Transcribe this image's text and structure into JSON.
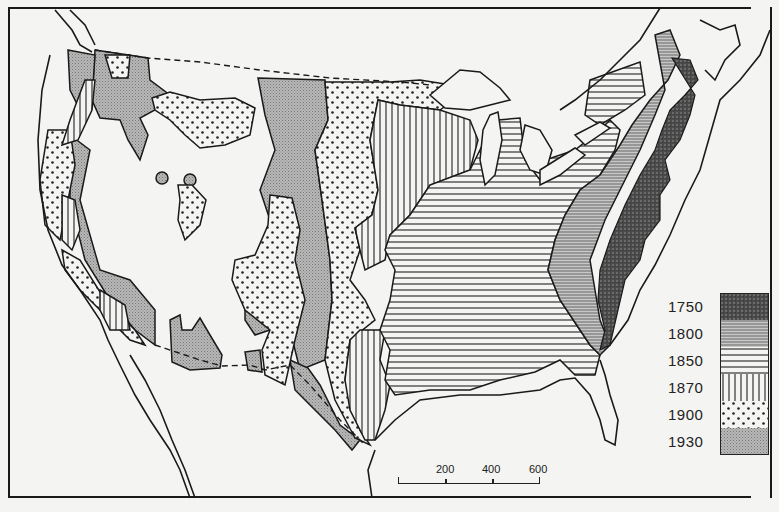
{
  "map": {
    "subject": "Settlement frontier of the United States by year",
    "background_color": "#f4f4f2",
    "line_color": "#1a1a1a"
  },
  "legend": {
    "items": [
      {
        "label": "1750",
        "pattern": "dark-stipple",
        "color": "#555555"
      },
      {
        "label": "1800",
        "pattern": "fine-horizontal-lines",
        "color": "#9a9a9a"
      },
      {
        "label": "1850",
        "pattern": "horizontal-lines",
        "color": "#ffffff"
      },
      {
        "label": "1870",
        "pattern": "vertical-lines",
        "color": "#ffffff"
      },
      {
        "label": "1900",
        "pattern": "dots",
        "color": "#ffffff"
      },
      {
        "label": "1930",
        "pattern": "fine-crosshatch",
        "color": "#bdbdbd"
      }
    ]
  },
  "scale": {
    "labels": [
      "200",
      "400",
      "600"
    ]
  }
}
